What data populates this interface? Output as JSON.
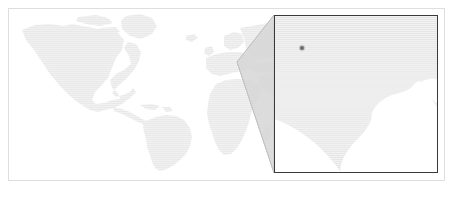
{
  "figure": {
    "type": "locator-map-with-inset",
    "kind": "world-map",
    "projection": "equirectangular",
    "background_color": "#ffffff",
    "frame_color": "#dedede",
    "land_color": "#e8e8e8",
    "ocean_color": "#ffffff",
    "has_labels": false,
    "has_axes": false,
    "has_legend": false
  },
  "overview_map": {
    "name": "world-overview",
    "bounds": {
      "x": 8,
      "y": 8,
      "width": 437,
      "height": 173
    },
    "land_color": "#e9e9e9",
    "visible_landmasses": [
      "North America",
      "South America",
      "Greenland",
      "Europe",
      "Africa",
      "Asia (western)"
    ]
  },
  "zoom_region": {
    "name": "highlighted-source-region",
    "description": "shaded wedge over western Europe / north-west Africa that is magnified in the inset",
    "fill_color": "#d6d6d6",
    "apex": {
      "x": 237,
      "y": 62
    },
    "connector_color": "#bdbdbd"
  },
  "inset": {
    "name": "zoom-inset-panel",
    "bounds": {
      "x": 274,
      "y": 15,
      "width": 164,
      "height": 158
    },
    "border_color": "#3a3a3a",
    "sea_color": "#e4e4e4",
    "land_color": "#ffffff",
    "marker": {
      "name": "location-marker",
      "color": "#6d6d6d",
      "x": 301,
      "y": 47,
      "radius": 2.3
    }
  }
}
